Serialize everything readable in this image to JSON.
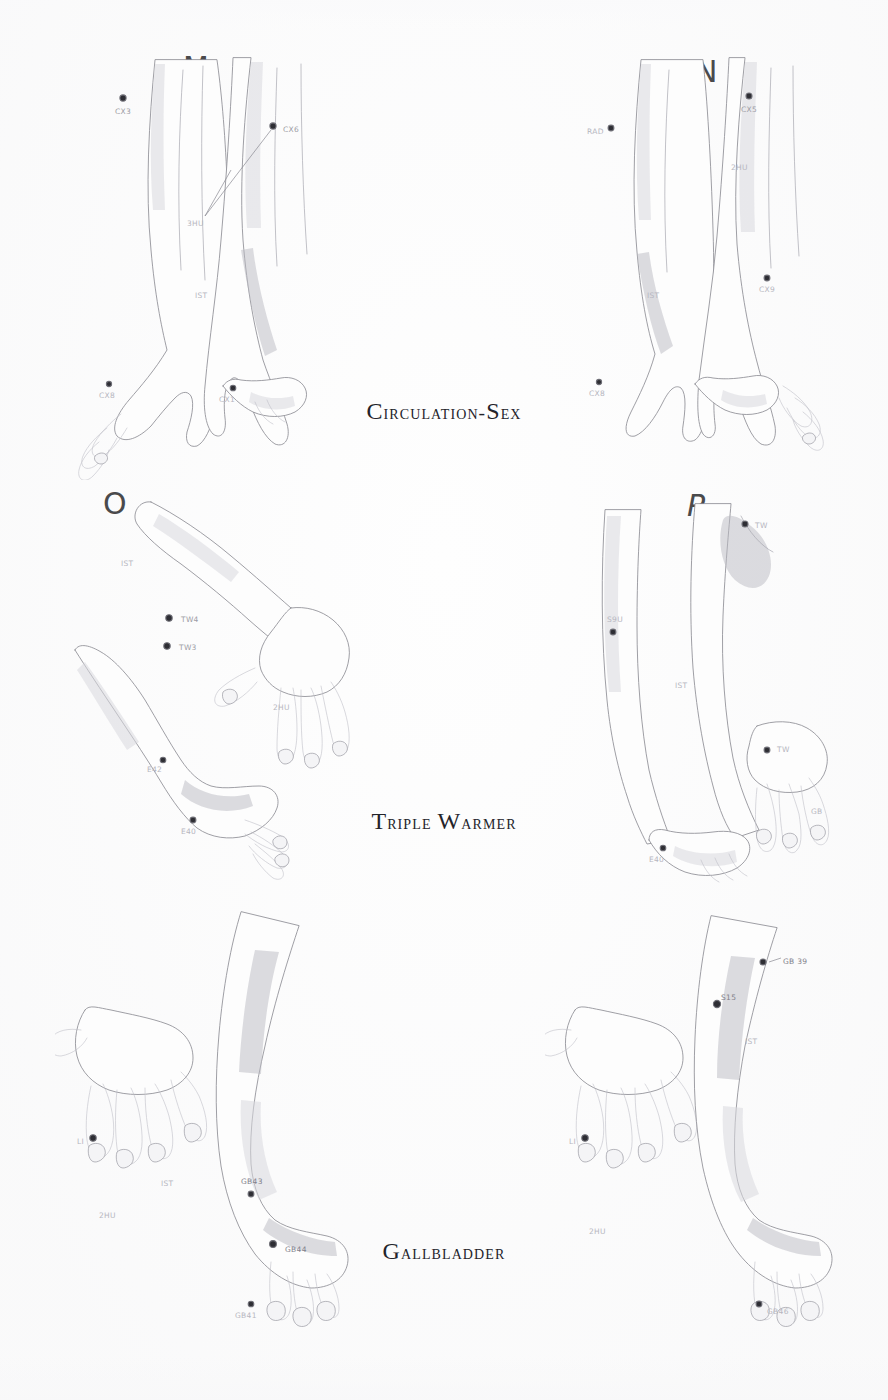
{
  "page": {
    "background_color": "#fefefe",
    "ink_color": "#23232a",
    "pencil_color": "#8e8e95",
    "point_marker_color": "#2e2e34"
  },
  "sections": [
    {
      "id": "circulation-sex",
      "label": "Circulation-Sex",
      "label_first_letter": "C",
      "label_rest": "irculation-",
      "label_second_cap": "S",
      "label_tail": "ex",
      "panels": [
        {
          "letter": "M",
          "side": "left",
          "subject": "forearms-and-hand-palmar-view",
          "points": [
            {
              "code": "CX3",
              "x": 78,
              "y": 60
            },
            {
              "code": "CX6",
              "x": 224,
              "y": 90
            },
            {
              "code": "3HU",
              "x": 150,
              "y": 180
            },
            {
              "code": "IST",
              "x": 150,
              "y": 258
            },
            {
              "code": "CX8",
              "x": 62,
              "y": 352
            },
            {
              "code": "CX1",
              "x": 172,
              "y": 352
            }
          ]
        },
        {
          "letter": "N",
          "side": "right",
          "subject": "forearms-and-hand-palmar-view",
          "points": [
            {
              "code": "RAD",
              "x": 52,
              "y": 92
            },
            {
              "code": "CX5",
              "x": 196,
              "y": 60
            },
            {
              "code": "2HU",
              "x": 186,
              "y": 130
            },
            {
              "code": "IST",
              "x": 108,
              "y": 258
            },
            {
              "code": "CX9",
              "x": 214,
              "y": 250
            },
            {
              "code": "CX8",
              "x": 60,
              "y": 352
            }
          ]
        }
      ]
    },
    {
      "id": "triple-warmer",
      "label": "Triple Warmer",
      "label_first_letter": "T",
      "label_rest": "riple ",
      "label_second_cap": "W",
      "label_tail": "armer",
      "panels": [
        {
          "letter": "O",
          "side": "left",
          "subject": "hand-dorsal-and-foot-dorsal-view",
          "points": [
            {
              "code": "TW4",
              "x": 126,
              "y": 140
            },
            {
              "code": "TW3",
              "x": 124,
              "y": 166
            },
            {
              "code": "IST",
              "x": 78,
              "y": 82
            },
            {
              "code": "2HU",
              "x": 228,
              "y": 228
            },
            {
              "code": "E42",
              "x": 118,
              "y": 282
            },
            {
              "code": "E40",
              "x": 150,
              "y": 348
            }
          ]
        },
        {
          "letter": "P",
          "side": "right",
          "subject": "forearm-hand-and-foot-dorsal-view",
          "points": [
            {
              "code": "TW",
              "x": 182,
              "y": 48
            },
            {
              "code": "S9U",
              "x": 78,
              "y": 148
            },
            {
              "code": "IST",
              "x": 136,
              "y": 208
            },
            {
              "code": "TW",
              "x": 204,
              "y": 274
            },
            {
              "code": "GB",
              "x": 258,
              "y": 330
            },
            {
              "code": "E40",
              "x": 112,
              "y": 356
            }
          ]
        }
      ]
    },
    {
      "id": "gallbladder",
      "label": "Gallbladder",
      "label_first_letter": "G",
      "label_rest": "allbladder",
      "label_second_cap": "",
      "label_tail": "",
      "panels": [
        {
          "letter": "Q",
          "side": "left",
          "subject": "hand-dorsal-and-foot-dorsal-view",
          "points": [
            {
              "code": "LI",
              "x": 40,
              "y": 236
            },
            {
              "code": "IST",
              "x": 112,
              "y": 284
            },
            {
              "code": "GB43",
              "x": 196,
              "y": 276
            },
            {
              "code": "GB44",
              "x": 222,
              "y": 322
            },
            {
              "code": "2HU",
              "x": 58,
              "y": 314
            },
            {
              "code": "GB41",
              "x": 176,
              "y": 360
            }
          ]
        },
        {
          "letter": "R",
          "side": "right",
          "subject": "hand-dorsal-and-foot-dorsal-view",
          "points": [
            {
              "code": "GB 39",
              "x": 238,
              "y": 62
            },
            {
              "code": "S15",
              "x": 180,
              "y": 102
            },
            {
              "code": "IST",
              "x": 206,
              "y": 140
            },
            {
              "code": "LI",
              "x": 42,
              "y": 236
            },
            {
              "code": "2HU",
              "x": 58,
              "y": 330
            },
            {
              "code": "GB46",
              "x": 198,
              "y": 364
            }
          ]
        }
      ]
    }
  ]
}
